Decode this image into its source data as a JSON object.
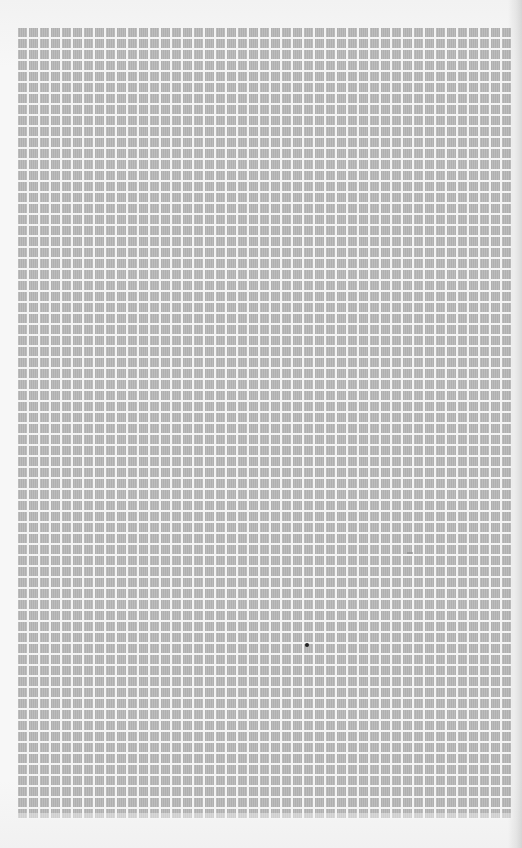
{
  "document": {
    "type": "scanned graph paper sheet",
    "colors": {
      "paper": "#f6f6f6",
      "cell_fill": "#b6b6b6",
      "grid_gap": "#f4f4f4",
      "mark": "#222222"
    },
    "grid": {
      "columns": 45,
      "rows": 72,
      "cell_pitch_px": 11
    },
    "marks": [
      {
        "name": "ink-dot",
        "x": 307,
        "y": 645
      },
      {
        "name": "faint-mark",
        "x": 410,
        "y": 553
      }
    ]
  }
}
